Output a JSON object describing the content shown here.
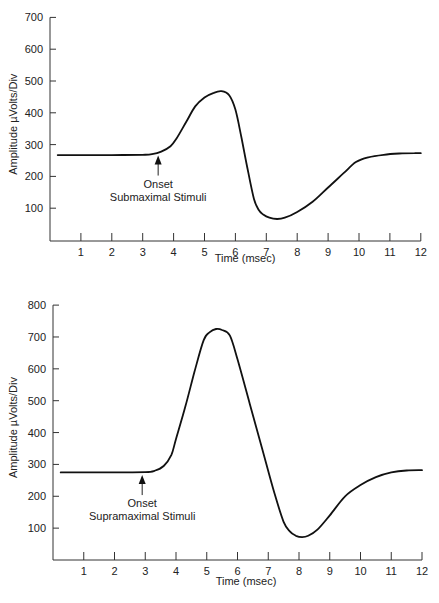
{
  "chart_data": [
    {
      "id": "top",
      "type": "line",
      "title": "",
      "xlabel": "Time (msec)",
      "ylabel": "Amplitude µVolts/Div",
      "xlim": [
        0,
        12
      ],
      "ylim": [
        0,
        700
      ],
      "x_ticks": [
        1,
        2,
        3,
        4,
        5,
        6,
        7,
        8,
        9,
        10,
        11,
        12
      ],
      "y_ticks": [
        100,
        200,
        300,
        400,
        500,
        600,
        700
      ],
      "grid": false,
      "annotation": {
        "line1": "Onset",
        "line2": "Submaximal Stimuli",
        "x": 3.5,
        "y": 275
      },
      "series": [
        {
          "name": "Submaximal response",
          "x": [
            0.25,
            1,
            2,
            3,
            3.3,
            3.6,
            3.9,
            4.1,
            4.4,
            4.7,
            5.0,
            5.3,
            5.55,
            5.8,
            6.0,
            6.2,
            6.4,
            6.6,
            6.75,
            6.9,
            7.1,
            7.35,
            7.6,
            8.0,
            8.5,
            9.0,
            9.5,
            9.9,
            10.3,
            10.8,
            11.3,
            11.8,
            12.0
          ],
          "y": [
            267,
            267,
            267,
            268,
            270,
            278,
            295,
            320,
            370,
            420,
            448,
            463,
            468,
            455,
            410,
            320,
            220,
            130,
            95,
            80,
            70,
            66,
            70,
            88,
            120,
            165,
            210,
            245,
            260,
            268,
            272,
            273,
            273
          ]
        }
      ]
    },
    {
      "id": "bottom",
      "type": "line",
      "title": "",
      "xlabel": "Time (msec)",
      "ylabel": "Amplitude µVolts/Div",
      "xlim": [
        0,
        12
      ],
      "ylim": [
        0,
        800
      ],
      "x_ticks": [
        1,
        2,
        3,
        4,
        5,
        6,
        7,
        8,
        9,
        10,
        11,
        12
      ],
      "y_ticks": [
        100,
        200,
        300,
        400,
        500,
        600,
        700,
        800
      ],
      "grid": false,
      "annotation": {
        "line1": "Onset",
        "line2": "Supramaximal Stimuli",
        "x": 2.9,
        "y": 276
      },
      "series": [
        {
          "name": "Supramaximal response",
          "x": [
            0.25,
            1,
            2,
            3,
            3.3,
            3.6,
            3.85,
            4.0,
            4.3,
            4.6,
            4.9,
            5.1,
            5.3,
            5.5,
            5.75,
            6.0,
            6.4,
            6.8,
            7.2,
            7.5,
            7.7,
            7.9,
            8.1,
            8.3,
            8.6,
            9.0,
            9.5,
            10.0,
            10.5,
            11.0,
            11.5,
            12.0
          ],
          "y": [
            275,
            275,
            275,
            276,
            280,
            295,
            330,
            380,
            480,
            590,
            690,
            715,
            725,
            722,
            705,
            630,
            490,
            350,
            210,
            120,
            90,
            76,
            72,
            76,
            95,
            140,
            200,
            235,
            260,
            275,
            281,
            282
          ]
        }
      ]
    }
  ]
}
